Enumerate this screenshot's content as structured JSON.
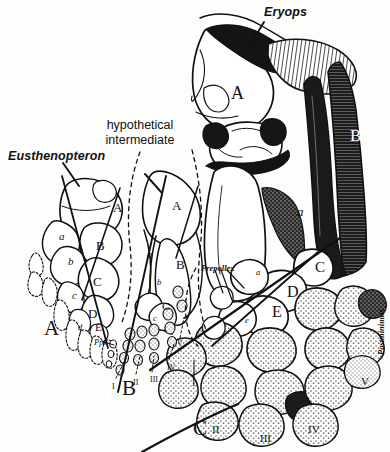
{
  "figure": {
    "background_color": "#fdfdfc",
    "ink_color": "#111111",
    "stipple_color": "#6b6b6b"
  },
  "annotations": {
    "taxon_left": "Eusthenopteron",
    "taxon_middle_line1": "hypothetical",
    "taxon_middle_line2": "intermediate",
    "taxon_right": "Eryops",
    "prepollex": "Prepollex",
    "postminimus": "Postminimus",
    "ppx": "Ppx"
  },
  "panels": [
    {
      "id": "A",
      "label": "A",
      "x": 44,
      "y": 318,
      "taxon": "Eusthenopteron"
    },
    {
      "id": "B",
      "label": "B",
      "x": 122,
      "y": 378,
      "taxon": "hypothetical intermediate"
    },
    {
      "id": "C",
      "label": "C",
      "x": 193,
      "y": 418,
      "taxon": "Eryops"
    }
  ],
  "bone_labels": {
    "panel_a": [
      {
        "text": "A",
        "x": 113,
        "y": 201
      },
      {
        "text": "a",
        "x": 59,
        "y": 231
      },
      {
        "text": "B",
        "x": 96,
        "y": 239
      },
      {
        "text": "b",
        "x": 68,
        "y": 256
      },
      {
        "text": "C",
        "x": 93,
        "y": 275
      },
      {
        "text": "c",
        "x": 72,
        "y": 290
      },
      {
        "text": "D",
        "x": 88,
        "y": 307
      },
      {
        "text": "d",
        "x": 78,
        "y": 323
      },
      {
        "text": "E",
        "x": 95,
        "y": 322
      }
    ],
    "panel_b": [
      {
        "text": "A",
        "x": 172,
        "y": 199
      },
      {
        "text": "a",
        "x": 147,
        "y": 249
      },
      {
        "text": "B",
        "x": 176,
        "y": 258
      },
      {
        "text": "b",
        "x": 157,
        "y": 278
      },
      {
        "text": "C",
        "x": 162,
        "y": 301
      },
      {
        "text": "c",
        "x": 153,
        "y": 314
      }
    ],
    "panel_c": [
      {
        "text": "A",
        "x": 231,
        "y": 92
      },
      {
        "text": "B",
        "x": 350,
        "y": 135
      },
      {
        "text": "a",
        "x": 299,
        "y": 209
      },
      {
        "text": "a",
        "x": 258,
        "y": 272
      },
      {
        "text": "C",
        "x": 317,
        "y": 268
      },
      {
        "text": "D",
        "x": 289,
        "y": 292
      },
      {
        "text": "E",
        "x": 274,
        "y": 312
      },
      {
        "text": "e",
        "x": 247,
        "y": 320
      }
    ]
  },
  "digits": {
    "panel_b": [
      {
        "text": "I",
        "x": 112,
        "y": 383
      },
      {
        "text": "II",
        "x": 133,
        "y": 379
      },
      {
        "text": "III",
        "x": 150,
        "y": 376
      },
      {
        "text": "IV",
        "x": 167,
        "y": 364
      },
      {
        "text": "V",
        "x": 177,
        "y": 340
      }
    ],
    "panel_c": [
      {
        "text": "I",
        "x": 192,
        "y": 382
      },
      {
        "text": "II",
        "x": 214,
        "y": 429
      },
      {
        "text": "III",
        "x": 262,
        "y": 437
      },
      {
        "text": "IV",
        "x": 310,
        "y": 428
      },
      {
        "text": "V",
        "x": 363,
        "y": 381
      }
    ]
  },
  "legend_note": "Homologous limb elements labelled A (humerus), B (radius/ulna), C-E (carpals); digits numbered I-V."
}
